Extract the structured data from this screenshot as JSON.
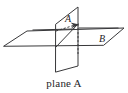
{
  "figure": {
    "type": "geometry-diagram",
    "caption": "plane A",
    "labels": {
      "vertical_plane": "A",
      "line": "B"
    },
    "colors": {
      "stroke": "#38383a",
      "hidden_stroke": "#3c3c3e",
      "text": "#1d1d1f",
      "caption_text": "#26262a",
      "background": "#ffffff"
    },
    "geometry": {
      "horizontal_plane": {
        "name": "horizontal-plane",
        "points": "4,46 27,31 124,28 104,45"
      },
      "vertical_plane": {
        "name": "vertical-plane",
        "points": "56,24 78,7 78,66 56,72"
      },
      "hidden_edges": [
        "56,31 78,24",
        "78,24 78,54"
      ],
      "visible_diagonal": "56,47 78,24",
      "line_b": {
        "start_x": 33,
        "start_y": 31,
        "end_x": 118,
        "end_y": 29
      },
      "arrow_tip": {
        "x": 78,
        "y": 24
      }
    },
    "label_positions": {
      "vertical_plane": {
        "x": 65,
        "y": 22
      },
      "line": {
        "x": 103,
        "y": 41
      }
    }
  }
}
